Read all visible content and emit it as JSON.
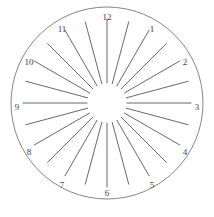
{
  "figure": {
    "width": 214,
    "height": 217
  },
  "geometry": {
    "center_x": 107,
    "center_y": 103,
    "outer_radius": 96,
    "hub_radius": 20,
    "spoke_outer_radius": 84,
    "label_radius": 90,
    "spoke_count": 24,
    "spoke_step_degrees": 15,
    "spoke_start_offset_degrees": 0
  },
  "style": {
    "background_color": "#ffffff",
    "circle_stroke": "#7a7774",
    "circle_stroke_width": 0.9,
    "spoke_stroke": "#5a5754",
    "spoke_stroke_width": 0.9,
    "label_color": "#44423f",
    "label_font_size": 9
  },
  "hour_labels": [
    {
      "value": "12",
      "angle_degrees": 0,
      "x": 107,
      "y": 18
    },
    {
      "value": "1",
      "angle_degrees": 30,
      "x": 152,
      "y": 30
    },
    {
      "value": "2",
      "angle_degrees": 60,
      "x": 185,
      "y": 63
    },
    {
      "value": "3",
      "angle_degrees": 90,
      "x": 197,
      "y": 108
    },
    {
      "value": "4",
      "angle_degrees": 120,
      "x": 185,
      "y": 153
    },
    {
      "value": "5",
      "angle_degrees": 150,
      "x": 152,
      "y": 186
    },
    {
      "value": "6",
      "angle_degrees": 180,
      "x": 107,
      "y": 194
    },
    {
      "value": "7",
      "angle_degrees": 210,
      "x": 62,
      "y": 186
    },
    {
      "value": "8",
      "angle_degrees": 240,
      "x": 29,
      "y": 153
    },
    {
      "value": "9",
      "angle_degrees": 270,
      "x": 17,
      "y": 108
    },
    {
      "value": "10",
      "angle_degrees": 300,
      "x": 29,
      "y": 63
    },
    {
      "value": "11",
      "angle_degrees": 330,
      "x": 62,
      "y": 30
    }
  ],
  "spokes": [
    {
      "index": 0,
      "angle_degrees": 0
    },
    {
      "index": 1,
      "angle_degrees": 15
    },
    {
      "index": 2,
      "angle_degrees": 30
    },
    {
      "index": 3,
      "angle_degrees": 45
    },
    {
      "index": 4,
      "angle_degrees": 60
    },
    {
      "index": 5,
      "angle_degrees": 75
    },
    {
      "index": 6,
      "angle_degrees": 90
    },
    {
      "index": 7,
      "angle_degrees": 105
    },
    {
      "index": 8,
      "angle_degrees": 120
    },
    {
      "index": 9,
      "angle_degrees": 135
    },
    {
      "index": 10,
      "angle_degrees": 150
    },
    {
      "index": 11,
      "angle_degrees": 165
    },
    {
      "index": 12,
      "angle_degrees": 180
    },
    {
      "index": 13,
      "angle_degrees": 195
    },
    {
      "index": 14,
      "angle_degrees": 210
    },
    {
      "index": 15,
      "angle_degrees": 225
    },
    {
      "index": 16,
      "angle_degrees": 240
    },
    {
      "index": 17,
      "angle_degrees": 255
    },
    {
      "index": 18,
      "angle_degrees": 270
    },
    {
      "index": 19,
      "angle_degrees": 285
    },
    {
      "index": 20,
      "angle_degrees": 300
    },
    {
      "index": 21,
      "angle_degrees": 315
    },
    {
      "index": 22,
      "angle_degrees": 330
    },
    {
      "index": 23,
      "angle_degrees": 345
    }
  ]
}
